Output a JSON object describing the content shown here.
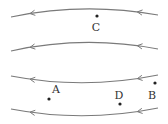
{
  "diagram": {
    "colors": {
      "line": "#7a7a7a",
      "point": "#222222",
      "label": "#333333"
    },
    "field_lines": [
      {
        "id": "line-1",
        "shape": "arches-up",
        "direction": "left"
      },
      {
        "id": "line-2",
        "shape": "arches-up",
        "direction": "left"
      },
      {
        "id": "line-3",
        "shape": "sags-down",
        "direction": "left"
      },
      {
        "id": "line-4",
        "shape": "sags-down",
        "direction": "left"
      }
    ],
    "points": [
      {
        "id": "C",
        "label": "C",
        "region": "between lines 1 and 2"
      },
      {
        "id": "A",
        "label": "A",
        "region": "between lines 3 and 4"
      },
      {
        "id": "D",
        "label": "D",
        "region": "between lines 3 and 4"
      },
      {
        "id": "B",
        "label": "B",
        "region": "between lines 3 and 4"
      }
    ]
  }
}
